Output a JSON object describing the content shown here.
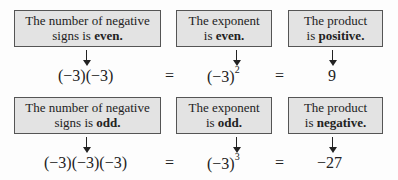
{
  "rows": [
    {
      "boxes": [
        {
          "line1": "The number of negative",
          "line2_plain": "signs is ",
          "line2_bold": "even."
        },
        {
          "line1": "The exponent",
          "line2_plain": "is ",
          "line2_bold": "even."
        },
        {
          "line1": "The product",
          "line2_plain": "is ",
          "line2_bold": "positive."
        }
      ],
      "product": "(−3)(−3)",
      "equals1": "=",
      "power_base": "(−3)",
      "power_exp": "2",
      "equals2": "=",
      "result": "9"
    },
    {
      "boxes": [
        {
          "line1": "The number of negative",
          "line2_plain": "signs is ",
          "line2_bold": "odd."
        },
        {
          "line1": "The exponent",
          "line2_plain": "is ",
          "line2_bold": "odd."
        },
        {
          "line1": "The product",
          "line2_plain": "is ",
          "line2_bold": "negative."
        }
      ],
      "product": "(−3)(−3)(−3)",
      "equals1": "=",
      "power_base": "(−3)",
      "power_exp": "3",
      "equals2": "=",
      "result": "−27"
    }
  ]
}
